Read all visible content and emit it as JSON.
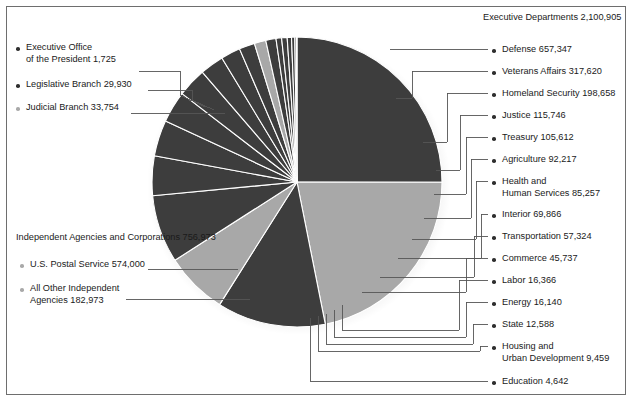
{
  "figure": {
    "top_clipped_caption": ". . .",
    "border_color": "#6e6e6e",
    "background": "#ffffff"
  },
  "palette": {
    "dark": "#3d3d3d",
    "light": "#a8a8a8",
    "mid": "#8f8f8f",
    "separator": "#ffffff",
    "leader": "#555555",
    "text": "#1a1a1a"
  },
  "groups": {
    "executive_departments": {
      "title": "Executive Departments",
      "total": "2,100,905"
    },
    "independent_agencies": {
      "title_line1": "Independent Agencies",
      "title_line2": "and Corporations  756,973"
    }
  },
  "left_labels": [
    {
      "name": "executive-office-of-the-president",
      "line1": "Executive Office",
      "line2": "of the President  1,725",
      "bullet": "dark"
    },
    {
      "name": "legislative-branch",
      "line1": "Legislative Branch  29,930",
      "line2": "",
      "bullet": "dark"
    },
    {
      "name": "judicial-branch",
      "line1": "Judicial Branch  33,754",
      "line2": "",
      "bullet": "light"
    }
  ],
  "left_group_labels": [
    {
      "name": "us-postal-service",
      "line1": "U.S. Postal Service  574,000",
      "line2": "",
      "bullet": "light"
    },
    {
      "name": "all-other-independent-agencies",
      "line1": "All Other Independent",
      "line2": "Agencies  182,973",
      "bullet": "light"
    }
  ],
  "right_labels": [
    {
      "name": "defense",
      "line1": "Defense  657,347",
      "line2": ""
    },
    {
      "name": "veterans-affairs",
      "line1": "Veterans Affairs  317,620",
      "line2": ""
    },
    {
      "name": "homeland-security",
      "line1": "Homeland Security  198,658",
      "line2": ""
    },
    {
      "name": "justice",
      "line1": "Justice  115,746",
      "line2": ""
    },
    {
      "name": "treasury",
      "line1": "Treasury  105,612",
      "line2": ""
    },
    {
      "name": "agriculture",
      "line1": "Agriculture  92,217",
      "line2": ""
    },
    {
      "name": "health-and-human-services",
      "line1": "Health and",
      "line2": "Human Services  85,257"
    },
    {
      "name": "interior",
      "line1": "Interior  69,866",
      "line2": ""
    },
    {
      "name": "transportation",
      "line1": "Transportation  57,324",
      "line2": ""
    },
    {
      "name": "commerce",
      "line1": "Commerce  45,737",
      "line2": ""
    },
    {
      "name": "labor",
      "line1": "Labor  16,366",
      "line2": ""
    },
    {
      "name": "energy",
      "line1": "Energy  16,140",
      "line2": ""
    },
    {
      "name": "state",
      "line1": "State  12,588",
      "line2": ""
    },
    {
      "name": "housing-and-urban-development",
      "line1": "Housing and",
      "line2": "Urban Development  9,459"
    },
    {
      "name": "education",
      "line1": "Education  4,642",
      "line2": ""
    }
  ],
  "chart_data": {
    "type": "pie",
    "title": "Executive Departments 2,100,905",
    "unit": "employees",
    "total": 2857878,
    "legend_position": "left-and-right callouts with leader lines",
    "categories": [
      "Defense",
      "U.S. Postal Service",
      "Veterans Affairs",
      "All Other Independent Agencies",
      "Homeland Security",
      "Justice",
      "Treasury",
      "Agriculture",
      "Health and Human Services",
      "Interior",
      "Transportation",
      "Commerce",
      "Judicial Branch",
      "Legislative Branch",
      "Labor",
      "Energy",
      "State",
      "Housing and Urban Development",
      "Education",
      "Executive Office of the President"
    ],
    "values": [
      657347,
      574000,
      317620,
      182973,
      198658,
      115746,
      105612,
      92217,
      85257,
      69866,
      57324,
      45737,
      33754,
      29930,
      16366,
      16140,
      12588,
      9459,
      4642,
      1725
    ],
    "slice_colors": [
      "#3d3d3d",
      "#a8a8a8",
      "#3d3d3d",
      "#a8a8a8",
      "#3d3d3d",
      "#3d3d3d",
      "#3d3d3d",
      "#3d3d3d",
      "#3d3d3d",
      "#3d3d3d",
      "#3d3d3d",
      "#3d3d3d",
      "#a8a8a8",
      "#3d3d3d",
      "#3d3d3d",
      "#3d3d3d",
      "#3d3d3d",
      "#3d3d3d",
      "#3d3d3d",
      "#3d3d3d"
    ],
    "group_totals": {
      "Executive Departments": 2100905,
      "Independent Agencies and Corporations": 756973,
      "Judicial Branch": 33754,
      "Legislative Branch": 29930,
      "Executive Office of the President": 1725
    }
  }
}
